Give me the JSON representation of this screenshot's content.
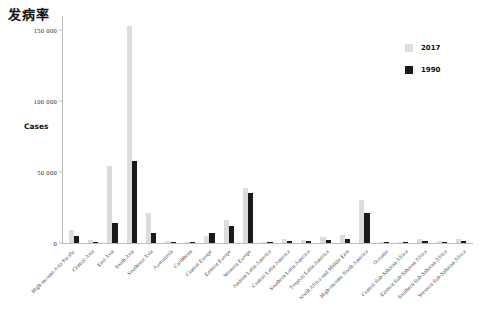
{
  "chart_data": {
    "type": "bar",
    "title": "发病率",
    "xlabel": "",
    "ylabel": "Cases",
    "ylim": [
      0,
      160000
    ],
    "yticks": [
      0,
      50000,
      100000,
      150000
    ],
    "ytick_labels": [
      "0",
      "50 000",
      "100 000",
      "150 000"
    ],
    "grid": false,
    "legend_position": "right",
    "categories": [
      "High-income Asia Pacific",
      "Central Asia",
      "East Asia",
      "South Asia",
      "Southeast Asia",
      "Australasia",
      "Caribbean",
      "Central Europe",
      "Eastern Europe",
      "Western Europe",
      "Andean Latin America",
      "Central Latin America",
      "Southern Latin America",
      "Tropical Latin America",
      "North Africa and Middle East",
      "High-income North America",
      "Oceania",
      "Central Sub-Saharan Africa",
      "Eastern Sub-Saharan Africa",
      "Southern Sub-Saharan Africa",
      "Western Sub-Saharan Africa"
    ],
    "series": [
      {
        "name": "2017",
        "color": "#dcdcdc",
        "values": [
          9000,
          2000,
          54000,
          153000,
          21000,
          1500,
          1000,
          5000,
          16000,
          39000,
          900,
          2500,
          2000,
          4500,
          6000,
          30000,
          300,
          800,
          2500,
          1500,
          2500
        ]
      },
      {
        "name": "1990",
        "color": "#1a1a1a",
        "values": [
          5000,
          1000,
          14000,
          58000,
          7000,
          600,
          500,
          7000,
          12000,
          35000,
          400,
          1200,
          1500,
          2000,
          2500,
          21000,
          150,
          400,
          1200,
          800,
          1200
        ]
      }
    ]
  },
  "legend": {
    "items": [
      {
        "label": "2017",
        "color": "#dcdcdc"
      },
      {
        "label": "1990",
        "color": "#1a1a1a"
      }
    ]
  }
}
